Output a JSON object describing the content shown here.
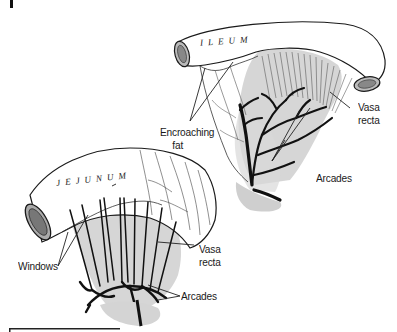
{
  "figure": {
    "panel_marker": "|",
    "organs": {
      "upper": "ILEUM",
      "lower": "JEJUNUM"
    },
    "labels": {
      "encroaching_fat_line1": "Encroaching",
      "encroaching_fat_line2": "fat",
      "vasa_recta_upper_line1": "Vasa",
      "vasa_recta_upper_line2": "recta",
      "arcades_upper": "Arcades",
      "windows": "Windows",
      "vasa_recta_lower_line1": "Vasa",
      "vasa_recta_lower_line2": "recta",
      "arcades_lower": "Arcades"
    },
    "colors": {
      "ink": "#1a1a1a",
      "mesentery_shade": "#c8c8c8",
      "background": "#ffffff"
    }
  }
}
